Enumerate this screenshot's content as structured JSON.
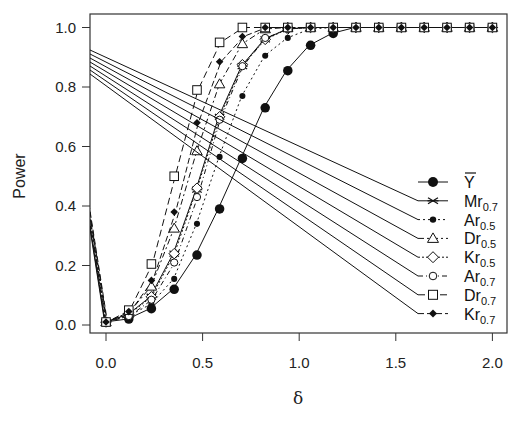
{
  "chart_data": {
    "type": "line",
    "title": "",
    "xlabel": "δ",
    "ylabel": "Power",
    "xlim": [
      -0.08,
      2.05
    ],
    "ylim": [
      -0.02,
      1.04
    ],
    "xticks": [
      0.0,
      0.5,
      1.0,
      1.5,
      2.0
    ],
    "xtick_labels": [
      "0.0",
      "0.5",
      "1.0",
      "1.5",
      "2.0"
    ],
    "yticks": [
      0.0,
      0.2,
      0.4,
      0.6,
      0.8,
      1.0
    ],
    "ytick_labels": [
      "0.0",
      "0.2",
      "0.4",
      "0.6",
      "0.8",
      "1.0"
    ],
    "grid": false,
    "legend_position": "right-center inside",
    "x": [
      -0.118,
      0.0,
      0.118,
      0.235,
      0.353,
      0.471,
      0.588,
      0.706,
      0.824,
      0.941,
      1.059,
      1.176,
      1.294,
      1.412,
      1.529,
      1.647,
      1.765,
      1.882,
      2.0
    ],
    "series": [
      {
        "name": "Ȳ",
        "label_main": "Y",
        "label_sub": "",
        "bar": true,
        "marker": "filled-circle-large",
        "dash": "",
        "values": [
          0.5,
          0.01,
          0.02,
          0.055,
          0.12,
          0.235,
          0.39,
          0.56,
          0.73,
          0.855,
          0.94,
          0.98,
          1.0,
          1.0,
          1.0,
          1.0,
          1.0,
          1.0,
          1.0
        ]
      },
      {
        "name": "Mr0.7",
        "label_main": "Mr",
        "label_sub": "0.7",
        "bar": false,
        "marker": "x-star",
        "dash": "",
        "values": [
          0.5,
          0.01,
          0.035,
          0.095,
          0.24,
          0.455,
          0.7,
          0.87,
          0.96,
          0.995,
          1.0,
          1.0,
          1.0,
          1.0,
          1.0,
          1.0,
          1.0,
          1.0,
          1.0
        ]
      },
      {
        "name": "Ar0.5",
        "label_main": "Ar",
        "label_sub": "0.5",
        "bar": false,
        "marker": "filled-circle-small",
        "dash": "2,3",
        "values": [
          0.5,
          0.01,
          0.03,
          0.07,
          0.155,
          0.34,
          0.565,
          0.77,
          0.905,
          0.965,
          0.995,
          1.0,
          1.0,
          1.0,
          1.0,
          1.0,
          1.0,
          1.0,
          1.0
        ]
      },
      {
        "name": "Dr0.5",
        "label_main": "Dr",
        "label_sub": "0.5",
        "bar": false,
        "marker": "triangle",
        "dash": "6,3,2,3",
        "values": [
          0.5,
          0.01,
          0.04,
          0.13,
          0.325,
          0.585,
          0.81,
          0.945,
          0.995,
          1.0,
          1.0,
          1.0,
          1.0,
          1.0,
          1.0,
          1.0,
          1.0,
          1.0,
          1.0
        ]
      },
      {
        "name": "Kr0.5",
        "label_main": "Kr",
        "label_sub": "0.5",
        "bar": false,
        "marker": "diamond",
        "dash": "2,2",
        "values": [
          0.5,
          0.01,
          0.035,
          0.095,
          0.24,
          0.46,
          0.7,
          0.875,
          0.96,
          0.995,
          1.0,
          1.0,
          1.0,
          1.0,
          1.0,
          1.0,
          1.0,
          1.0,
          1.0
        ]
      },
      {
        "name": "Ar0.7",
        "label_main": "Ar",
        "label_sub": "0.7",
        "bar": false,
        "marker": "circle",
        "dash": "5,3,1,3",
        "values": [
          0.5,
          0.01,
          0.03,
          0.085,
          0.21,
          0.43,
          0.69,
          0.87,
          0.965,
          0.995,
          1.0,
          1.0,
          1.0,
          1.0,
          1.0,
          1.0,
          1.0,
          1.0,
          1.0
        ]
      },
      {
        "name": "Dr0.7",
        "label_main": "Dr",
        "label_sub": "0.7",
        "bar": false,
        "marker": "square",
        "dash": "7,4",
        "values": [
          0.5,
          0.01,
          0.05,
          0.205,
          0.5,
          0.79,
          0.95,
          1.0,
          1.0,
          1.0,
          1.0,
          1.0,
          1.0,
          1.0,
          1.0,
          1.0,
          1.0,
          1.0,
          1.0
        ]
      },
      {
        "name": "Kr0.7",
        "label_main": "Kr",
        "label_sub": "0.7",
        "bar": false,
        "marker": "filled-diamond",
        "dash": "6,3",
        "values": [
          0.5,
          0.01,
          0.045,
          0.15,
          0.38,
          0.68,
          0.885,
          0.97,
          1.0,
          1.0,
          1.0,
          1.0,
          1.0,
          1.0,
          1.0,
          1.0,
          1.0,
          1.0,
          1.0
        ]
      }
    ],
    "annotations": "Legend entries are connected by straight leader lines from the left plot edge (power ≈ 0.86–0.94)."
  },
  "colors": {
    "ink": "#111111",
    "axis": "#333333",
    "background": "#ffffff"
  }
}
